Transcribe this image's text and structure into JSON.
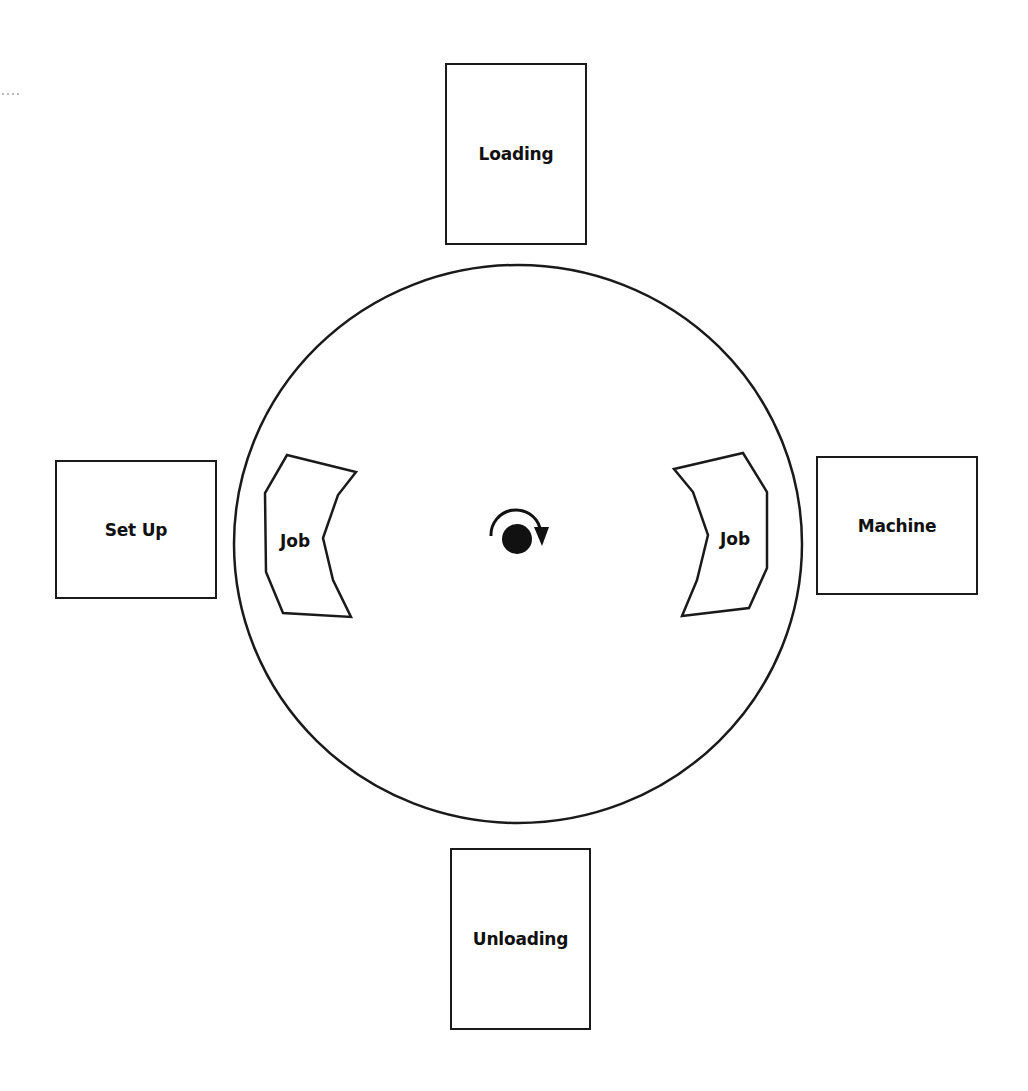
{
  "diagram": {
    "type": "rotary indexing table",
    "stations": [
      {
        "id": "loading",
        "label": "Loading",
        "position": "top"
      },
      {
        "id": "setup",
        "label": "Set Up",
        "position": "left"
      },
      {
        "id": "machine",
        "label": "Machine",
        "position": "right"
      },
      {
        "id": "unloading",
        "label": "Unloading",
        "position": "bottom"
      }
    ],
    "jobs": [
      {
        "id": "job-left",
        "label": "Job",
        "position": "left"
      },
      {
        "id": "job-right",
        "label": "Job",
        "position": "right"
      }
    ],
    "rotation": {
      "direction": "clockwise",
      "icon": "rotate-clockwise-arrow"
    },
    "colors": {
      "stroke": "#1a1a1a",
      "background": "#ffffff"
    }
  }
}
